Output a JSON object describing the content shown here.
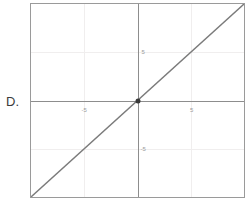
{
  "choice": {
    "letter": "D."
  },
  "colors": {
    "frame": "#9a9a9a",
    "axis": "#8d8d8d",
    "grid": "#f0eeee",
    "line": "#7b7b7b",
    "point": "#3a3a3a",
    "tick_text": "#9b9b9b",
    "letter_text": "#3b3b3b",
    "background": "#ffffff"
  },
  "chart_data": {
    "type": "line",
    "title": "",
    "subtitle": "",
    "xlabel": "",
    "ylabel": "",
    "xlim": [
      -10,
      10
    ],
    "ylim": [
      -10,
      10
    ],
    "grid": true,
    "legend": "none",
    "equation": "y = x",
    "x_ticks": [
      -5,
      5
    ],
    "y_ticks": [
      -5,
      5
    ],
    "x_tick_labels": [
      "-5",
      "5"
    ],
    "y_tick_labels": [
      "-5",
      "5"
    ],
    "series": [
      {
        "name": "y = x",
        "x": [
          -10,
          10
        ],
        "values": [
          -10,
          10
        ]
      }
    ],
    "points": [
      {
        "label": "origin",
        "x": 0,
        "y": 0
      }
    ],
    "annotations": []
  }
}
